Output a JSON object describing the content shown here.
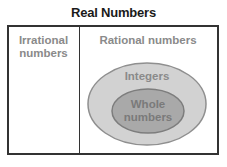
{
  "title": "Real Numbers",
  "regions": {
    "irrational": {
      "line1": "Irrational",
      "line2": "numbers"
    },
    "rational": {
      "label": "Rational numbers"
    },
    "integers": {
      "label": "Integers"
    },
    "whole": {
      "line1": "Whole",
      "line2": "numbers"
    }
  },
  "colors": {
    "border": "#333333",
    "outer_ellipse_fill": "#d2d2d2",
    "outer_ellipse_stroke": "#8f8f8f",
    "inner_ellipse_fill": "#a9a9a9",
    "inner_ellipse_stroke": "#7d7d7d",
    "label_text": "#8a8a8a"
  }
}
